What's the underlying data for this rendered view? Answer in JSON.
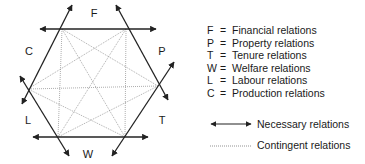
{
  "diagram": {
    "vertices": [
      {
        "id": "FC",
        "x": 62,
        "y": 29
      },
      {
        "id": "FP",
        "x": 126,
        "y": 29
      },
      {
        "id": "PT",
        "x": 158,
        "y": 86
      },
      {
        "id": "TW",
        "x": 125,
        "y": 137
      },
      {
        "id": "WL",
        "x": 58,
        "y": 137
      },
      {
        "id": "LC",
        "x": 28,
        "y": 89
      }
    ],
    "sides": [
      {
        "label": "F",
        "x": 94,
        "y": 17
      },
      {
        "label": "P",
        "x": 162,
        "y": 55
      },
      {
        "label": "T",
        "x": 162,
        "y": 124
      },
      {
        "label": "W",
        "x": 88,
        "y": 158
      },
      {
        "label": "L",
        "x": 28,
        "y": 124
      },
      {
        "label": "C",
        "x": 29,
        "y": 55
      }
    ],
    "necessary_lines": [
      {
        "x1": 40,
        "y1": 29,
        "x2": 156,
        "y2": 29
      },
      {
        "x1": 33,
        "y1": 137,
        "x2": 148,
        "y2": 137
      },
      {
        "x1": 22,
        "y1": 104,
        "x2": 72,
        "y2": 5
      },
      {
        "x1": 116,
        "y1": 5,
        "x2": 168,
        "y2": 100
      },
      {
        "x1": 20,
        "y1": 76,
        "x2": 69,
        "y2": 156
      },
      {
        "x1": 112,
        "y1": 156,
        "x2": 174,
        "y2": 62
      }
    ],
    "colors": {
      "line": "#222222",
      "dotted": "#8a8a8a",
      "text": "#1a1a1a"
    }
  },
  "legend": {
    "items": [
      {
        "key": "F",
        "eq": "=",
        "label": "Financial relations"
      },
      {
        "key": "P",
        "eq": "=",
        "label": "Property relations"
      },
      {
        "key": "T",
        "eq": "=",
        "label": "Tenure relations"
      },
      {
        "key": "W",
        "eq": "=",
        "label": "Welfare relations"
      },
      {
        "key": "L",
        "eq": "=",
        "label": "Labour relations"
      },
      {
        "key": "C",
        "eq": "=",
        "label": "Production relations"
      }
    ],
    "necessary": "Necessary relations",
    "contingent": "Contingent relations"
  }
}
